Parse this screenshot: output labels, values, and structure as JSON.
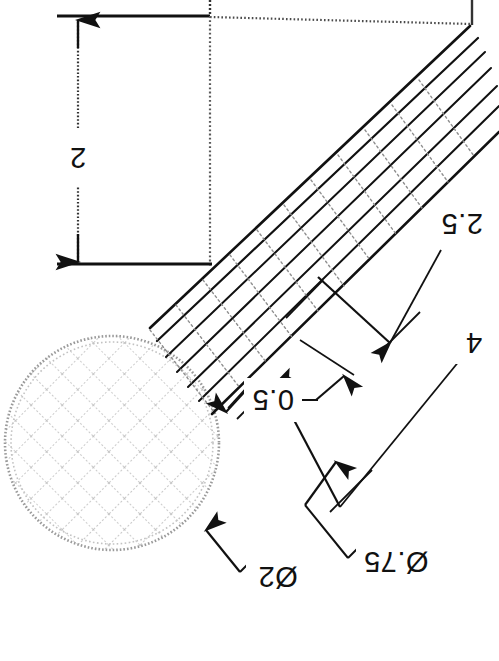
{
  "drawing": {
    "title": "Knurled ball-end shaft detail",
    "orientation_note": "Scanned sheet reproduced upside-down; all dimension text is rotated 180 degrees.",
    "background_color": "#ffffff",
    "line_color": "#111111",
    "hatch_color": "#b9b9b9",
    "construction_color": "#6f6f6f",
    "dimensions": [
      {
        "id": "height-2",
        "label": "2",
        "kind": "linear-vertical",
        "text_x": 78,
        "text_y": 158,
        "rotated": true
      },
      {
        "id": "length-2p5",
        "label": "2.5",
        "kind": "linear-aligned",
        "text_x": 462,
        "text_y": 226,
        "rotated": true
      },
      {
        "id": "length-4",
        "label": "4",
        "kind": "linear-aligned",
        "text_x": 474,
        "text_y": 344,
        "rotated": true
      },
      {
        "id": "width-0p5",
        "label": "0.5",
        "kind": "linear-aligned",
        "text_x": 277,
        "text_y": 400,
        "rotated": true
      },
      {
        "id": "diameter-0p75",
        "label": "Ø.75",
        "kind": "diameter-leader",
        "text_x": 392,
        "text_y": 562,
        "rotated": true
      },
      {
        "id": "diameter-2",
        "label": "Ø2",
        "kind": "diameter-leader",
        "text_x": 277,
        "text_y": 577,
        "rotated": true
      }
    ],
    "features": [
      {
        "id": "knurled-ball",
        "name": "knurled ball end",
        "cx": 112,
        "cy": 443,
        "r": 108
      },
      {
        "id": "tapered-shaft",
        "name": "tapered shaft body"
      },
      {
        "id": "datum-top-line",
        "name": "top reference edge"
      },
      {
        "id": "datum-bottom-line",
        "name": "lower reference edge"
      }
    ]
  }
}
